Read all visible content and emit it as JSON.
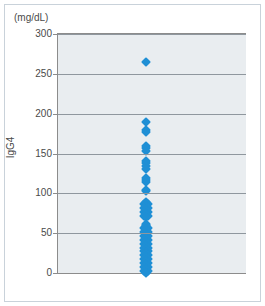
{
  "figure": {
    "unit_label": "(mg/dL)",
    "axis_title": "IgG4"
  },
  "chart_data": {
    "type": "scatter",
    "title": "",
    "subtitle": "",
    "xlabel": "",
    "ylabel": "IgG4",
    "unit": "mg/dL",
    "ylim": [
      0,
      300
    ],
    "yticks": [
      0,
      50,
      100,
      150,
      200,
      250,
      300
    ],
    "ytick_labels": [
      "0",
      "50",
      "100",
      "150",
      "200",
      "250",
      "300"
    ],
    "grid": true,
    "legend": "none",
    "series": [
      {
        "name": "IgG4",
        "color": "#1f8fd5",
        "marker": "diamond",
        "x_category": "all patients",
        "values": [
          265,
          189,
          179,
          177,
          159,
          157,
          153,
          141,
          138,
          134,
          131,
          119,
          117,
          114,
          104,
          103,
          89,
          88,
          87,
          86,
          85,
          84,
          83,
          82,
          81,
          80,
          79,
          78,
          77,
          76,
          75,
          74,
          73,
          72,
          71,
          70,
          61,
          60,
          59,
          58,
          57,
          56,
          55,
          54,
          53,
          52,
          51,
          50,
          49,
          48,
          47,
          46,
          45,
          44,
          43,
          42,
          41,
          40,
          39,
          38,
          37,
          36,
          35,
          34,
          33,
          32,
          31,
          30,
          29,
          28,
          27,
          26,
          25,
          24,
          23,
          22,
          21,
          20,
          19,
          18,
          17,
          16,
          15,
          14,
          13,
          12,
          11,
          10,
          9,
          8,
          7,
          6,
          5,
          4,
          3,
          2,
          1,
          0
        ]
      }
    ]
  }
}
